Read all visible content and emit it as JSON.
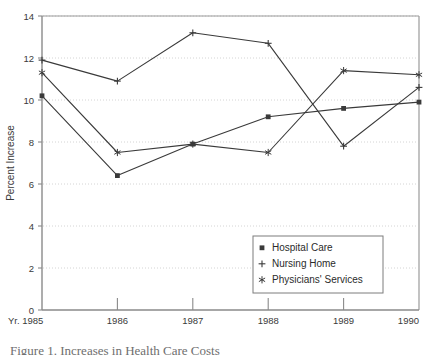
{
  "chart_data": {
    "type": "line",
    "title": "",
    "subtitle": "",
    "xlabel": "",
    "ylabel": "Percent Increase",
    "x_prefix_label": "Yr.",
    "categories": [
      "1985",
      "1986",
      "1987",
      "1988",
      "1989",
      "1990"
    ],
    "x_tick_labels": [
      "Yr. 1985",
      "1986",
      "1987",
      "1988",
      "1989",
      "1990"
    ],
    "y_tick_labels": [
      "0",
      "2",
      "4",
      "6",
      "8",
      "10",
      "12",
      "14"
    ],
    "y_ticks": [
      0,
      2,
      4,
      6,
      8,
      10,
      12,
      14
    ],
    "ylim": [
      0,
      14
    ],
    "grid": true,
    "grid_axis": "y",
    "legend_position": "inside-bottom-right",
    "series": [
      {
        "name": "Hospital Care",
        "marker": "filled-square",
        "values": [
          10.2,
          6.4,
          7.9,
          9.2,
          9.6,
          9.9
        ]
      },
      {
        "name": "Nursing Home",
        "marker": "plus",
        "values": [
          11.9,
          10.9,
          13.2,
          12.7,
          7.8,
          10.6
        ]
      },
      {
        "name": "Physicians' Services",
        "marker": "asterisk",
        "values": [
          11.3,
          7.5,
          7.9,
          7.5,
          11.4,
          11.2
        ]
      }
    ],
    "colors": {
      "line": "#3a3a3a",
      "grid": "#cfcfcf",
      "axis": "#8a8a8a",
      "frame": "#9a9a9a",
      "background": "#ffffff"
    }
  },
  "legend": {
    "items": [
      {
        "label": "Hospital Care",
        "marker": "filled-square"
      },
      {
        "label": "Nursing Home",
        "marker": "plus"
      },
      {
        "label": "Physicians' Services",
        "marker": "asterisk"
      }
    ]
  },
  "caption": {
    "text": "Figure 1.   Increases in Health Care Costs"
  }
}
